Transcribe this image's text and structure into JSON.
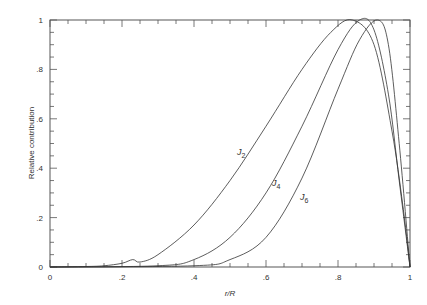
{
  "chart_data": {
    "type": "line",
    "title": "",
    "xlabel": "r/R",
    "ylabel": "Relative contribution",
    "xlim": [
      0,
      1
    ],
    "ylim": [
      0,
      1
    ],
    "x_ticks": [
      "0",
      ".2",
      ".4",
      ".6",
      ".8",
      "1"
    ],
    "y_ticks": [
      "0",
      ".2",
      ".4",
      ".6",
      ".8",
      "1"
    ],
    "grid": false,
    "legend": "inline labels",
    "series": [
      {
        "name": "J2",
        "label_main": "J",
        "label_sub": "2",
        "x": [
          0,
          0.1,
          0.15,
          0.2,
          0.23,
          0.25,
          0.3,
          0.4,
          0.5,
          0.6,
          0.7,
          0.78,
          0.84,
          0.9,
          0.95,
          0.98,
          1.0
        ],
        "y": [
          0,
          0.002,
          0.005,
          0.015,
          0.03,
          0.02,
          0.05,
          0.17,
          0.35,
          0.57,
          0.8,
          0.95,
          1.0,
          0.9,
          0.55,
          0.25,
          0
        ]
      },
      {
        "name": "J4",
        "label_main": "J",
        "label_sub": "4",
        "x": [
          0,
          0.3,
          0.4,
          0.5,
          0.6,
          0.7,
          0.8,
          0.86,
          0.9,
          0.94,
          0.97,
          1.0
        ],
        "y": [
          0,
          0.005,
          0.03,
          0.12,
          0.3,
          0.57,
          0.88,
          1.0,
          0.96,
          0.7,
          0.35,
          0
        ]
      },
      {
        "name": "J6",
        "label_main": "J",
        "label_sub": "6",
        "x": [
          0,
          0.4,
          0.5,
          0.6,
          0.7,
          0.8,
          0.86,
          0.91,
          0.94,
          0.97,
          1.0
        ],
        "y": [
          0,
          0.005,
          0.03,
          0.12,
          0.36,
          0.72,
          0.92,
          1.0,
          0.9,
          0.5,
          0
        ]
      }
    ]
  }
}
